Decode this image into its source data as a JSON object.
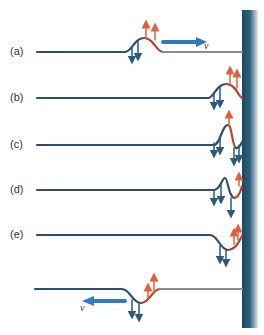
{
  "figure": {
    "panels": [
      {
        "label": "(a)",
        "y": 52,
        "note": "upright pulse travelling right toward wall"
      },
      {
        "label": "(b)",
        "y": 98,
        "note": "pulse reaching wall"
      },
      {
        "label": "(c)",
        "y": 145,
        "note": "pulse reflecting, partially inverted"
      },
      {
        "label": "(d)",
        "y": 190,
        "note": "pulse mostly inverted at wall"
      },
      {
        "label": "(e)",
        "y": 235,
        "note": "inverted pulse leaving wall"
      },
      {
        "label": "",
        "y": 289,
        "note": "inverted pulse travelling left"
      }
    ],
    "velocity_label": "v",
    "colors": {
      "string": "#8a8d91",
      "leading_edge": "#b5412a",
      "trailing_edge": "#2c4f6b",
      "up_arrow": "#e0603a",
      "down_arrow": "#2a5a7e",
      "velocity_arrow": "#2f7bbf",
      "wall": "#2e5a74"
    }
  }
}
